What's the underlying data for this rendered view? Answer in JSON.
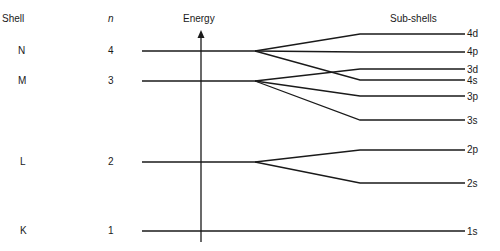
{
  "headers": {
    "shell": "Shell",
    "n": "n",
    "energy": "Energy",
    "subshells": "Sub-shells"
  },
  "shells": [
    {
      "name": "N",
      "n": "4"
    },
    {
      "name": "M",
      "n": "3"
    },
    {
      "name": "L",
      "n": "2"
    },
    {
      "name": "K",
      "n": "1"
    }
  ],
  "subshells": [
    "4d",
    "4p",
    "3d",
    "4s",
    "3p",
    "3s",
    "2p",
    "2s",
    "1s"
  ],
  "colors": {
    "line": "#1a1a1a",
    "background": "#ffffff"
  }
}
